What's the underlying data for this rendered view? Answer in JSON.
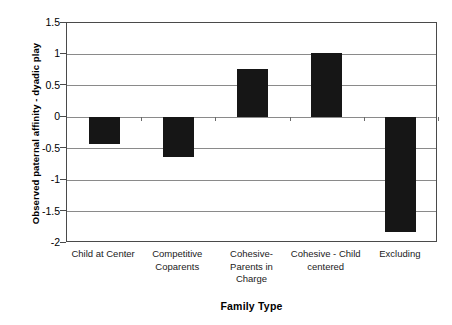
{
  "chart_data": {
    "type": "bar",
    "title": "",
    "xlabel": "Family Type",
    "ylabel": "Observed paternal affinity - dyadic play",
    "categories": [
      "Child at Center",
      "Competitive Coparents",
      "Cohesive-Parents in Charge",
      "Cohesive - Child centered",
      "Excluding"
    ],
    "values": [
      -0.42,
      -0.63,
      0.77,
      1.03,
      -1.83
    ],
    "ylim": [
      -2,
      1.5
    ],
    "ytick_labels": [
      "1.5",
      "1",
      "0.5",
      "0",
      "-0.5",
      "-1",
      "-1.5",
      "-2"
    ],
    "ytick_values": [
      1.5,
      1,
      0.5,
      0,
      -0.5,
      -1,
      -1.5,
      -2
    ],
    "grid": true,
    "legend": "none",
    "bar_color": "#161616",
    "axis_color": "#4a4a4a",
    "grid_color": "#8a8a8a"
  },
  "axes": {
    "y_title": "Observed paternal affinity - dyadic play",
    "x_title": "Family Type"
  }
}
